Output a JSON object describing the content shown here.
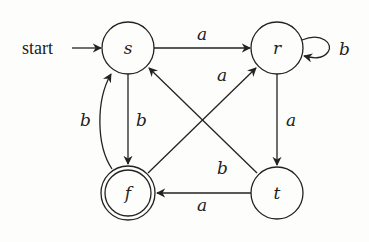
{
  "diagram": {
    "type": "finite-automaton",
    "start_label": "start",
    "start_state": "s",
    "accepting_states": [
      "f"
    ],
    "nodes": {
      "s": {
        "label": "s",
        "accepting": false
      },
      "r": {
        "label": "r",
        "accepting": false
      },
      "f": {
        "label": "f",
        "accepting": true
      },
      "t": {
        "label": "t",
        "accepting": false
      }
    },
    "edges": {
      "s_to_r": {
        "from": "s",
        "to": "r",
        "label": "a"
      },
      "r_to_r": {
        "from": "r",
        "to": "r",
        "label": "b"
      },
      "s_to_f": {
        "from": "s",
        "to": "f",
        "label": "b"
      },
      "f_to_s": {
        "from": "f",
        "to": "s",
        "label": "b"
      },
      "f_to_r": {
        "from": "f",
        "to": "r",
        "label": "a"
      },
      "t_to_s": {
        "from": "t",
        "to": "s",
        "label": "b"
      },
      "r_to_t": {
        "from": "r",
        "to": "t",
        "label": "a"
      },
      "t_to_f": {
        "from": "t",
        "to": "f",
        "label": "a"
      }
    },
    "colors": {
      "stroke": "#222222",
      "background": "#fdfdfb"
    }
  }
}
